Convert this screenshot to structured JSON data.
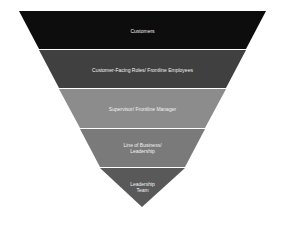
{
  "diagram": {
    "type": "inverted-pyramid",
    "levels": [
      {
        "label": "Customers",
        "color": "#0d0d0d"
      },
      {
        "label": "Customer-Facing Roles/ Frontline Employees",
        "color": "#404040"
      },
      {
        "label": "Supervisor/ Frontline Manager",
        "color": "#8c8c8c"
      },
      {
        "label": "Line of Business/ Leadership",
        "line1": "Line of Business/",
        "line2": "Leadership",
        "color": "#7a7a7a"
      },
      {
        "label": "Leadership Team",
        "line1": "Leadership",
        "line2": "Team",
        "color": "#595959"
      }
    ]
  }
}
